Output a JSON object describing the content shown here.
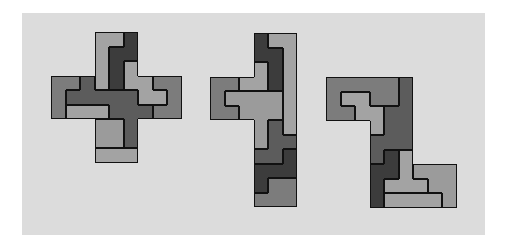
{
  "figure": {
    "background": "#dcdcdc",
    "outline_color": "#111111",
    "palette": {
      "L": "#a3a3a3",
      "L2": "#9b9b9b",
      "M": "#7c7c7c",
      "MD": "#5c5c5c",
      "D": "#3c3c3c"
    },
    "cell_size": 14.5,
    "shapes": [
      {
        "name": "cross-shape",
        "origin": [
          51,
          32
        ],
        "rows": [
          "...LLD...",
          "...LDD...",
          "...LDL...",
          "MMXLDLLMM",
          "MXXXXXLLM",
          "MLLLXXXMM",
          "...llX...",
          "...llX...",
          "...ppp..."
        ],
        "pieces": {
          "L": "L",
          "D": "D",
          "M": "M",
          "X": "MD",
          "l": "L2",
          "p": "L"
        }
      },
      {
        "name": "column-shape",
        "origin": [
          210,
          33
        ],
        "rows": [
          "...DLL",
          "...DDL",
          "...ADL",
          "MMAADL",
          "MBBBBL",
          "MMBBBL",
          "...BXL",
          "...BXX",
          "...XXD",
          "...DDD",
          "...DMM",
          "...MMM"
        ],
        "pieces": {
          "D": "D",
          "L": "L",
          "A": "L",
          "B": "L2",
          "M": "M",
          "X": "MD"
        }
      },
      {
        "name": "hook-shape",
        "origin": [
          326,
          77
        ],
        "rows": [
          "MMMMMX...",
          "MLLMMX...",
          "MMLLXX...",
          "...LXX...",
          "...XXX...",
          "...XDL...",
          "...DDLBBB",
          "...DLLLBB",
          "...DCCCCB"
        ],
        "pieces": {
          "M": "M",
          "X": "MD",
          "L": "L",
          "D": "D",
          "B": "L2",
          "C": "L"
        }
      }
    ]
  }
}
